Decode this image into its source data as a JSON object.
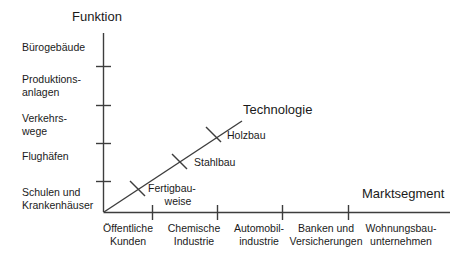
{
  "diagram": {
    "title_vertical": "Funktion",
    "title_diagonal": "Technologie",
    "title_horizontal": "Marktsegment",
    "background_color": "#ffffff",
    "line_color": "#3d3d3d"
  },
  "axes": {
    "vertical": {
      "label": "Funktion",
      "categories": [
        {
          "label_line1": "Bürogebäude",
          "label_line2": ""
        },
        {
          "label_line1": "Produktions-",
          "label_line2": "anlagen"
        },
        {
          "label_line1": "Verkehrs-",
          "label_line2": "wege"
        },
        {
          "label_line1": "Flughäfen",
          "label_line2": ""
        },
        {
          "label_line1": "Schulen und",
          "label_line2": "Krankenhäuser"
        }
      ]
    },
    "horizontal": {
      "label": "Marktsegment",
      "categories": [
        {
          "label_line1": "Öffentliche",
          "label_line2": "Kunden"
        },
        {
          "label_line1": "Chemische",
          "label_line2": "Industrie"
        },
        {
          "label_line1": "Automobil-",
          "label_line2": "industrie"
        },
        {
          "label_line1": "Banken und",
          "label_line2": "Versicherungen"
        },
        {
          "label_line1": "Wohnungsbau-",
          "label_line2": "unternehmen"
        }
      ]
    },
    "diagonal": {
      "label": "Technologie",
      "markers": [
        {
          "label_line1": "Fertigbau-",
          "label_line2": "weise"
        },
        {
          "label_line1": "Stahlbau",
          "label_line2": ""
        },
        {
          "label_line1": "Holzbau",
          "label_line2": ""
        }
      ]
    }
  }
}
